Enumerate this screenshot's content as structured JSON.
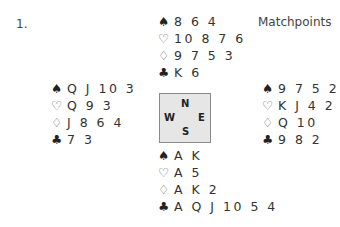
{
  "board": {
    "number_label": "1.",
    "scoring": "Matchpoints"
  },
  "suit_symbols": {
    "spades": "♠",
    "hearts": "♡",
    "diamonds": "♢",
    "clubs": "♣"
  },
  "hands": {
    "north": {
      "spades": "8 6 4",
      "hearts": "10 8 7 6",
      "diamonds": "9 7 5 3",
      "clubs": "K 6"
    },
    "west": {
      "spades": "Q J 10 3",
      "hearts": "Q 9 3",
      "diamonds": "J 8 6 4",
      "clubs": "7 3"
    },
    "east": {
      "spades": "9 7 5 2",
      "hearts": "K J 4 2",
      "diamonds": "Q 10",
      "clubs": "9 8 2"
    },
    "south": {
      "spades": "A K",
      "hearts": "A 5",
      "diamonds": "A K 2",
      "clubs": "A Q J 10 5 4"
    }
  },
  "compass": {
    "n": "N",
    "w": "W",
    "e": "E",
    "s": "S"
  }
}
